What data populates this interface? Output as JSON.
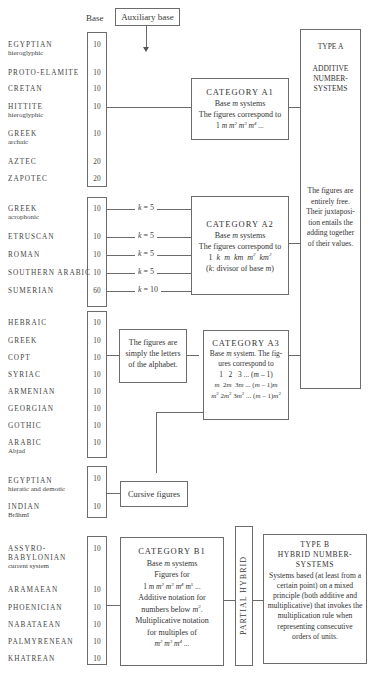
{
  "header": {
    "base_label": "Base",
    "auxiliary_base_label": "Auxiliary base"
  },
  "group1": {
    "systems": [
      {
        "name": "EGYPTIAN",
        "sub": "hieroglyphic",
        "base": "10"
      },
      {
        "name": "PROTO-ELAMITE",
        "sub": "",
        "base": "10"
      },
      {
        "name": "CRETAN",
        "sub": "",
        "base": "10"
      },
      {
        "name": "HITTITE",
        "sub": "hieroglyphic",
        "base": "10"
      },
      {
        "name": "GREEK",
        "sub": "archaic",
        "base": "10"
      },
      {
        "name": "AZTEC",
        "sub": "",
        "base": "20"
      },
      {
        "name": "ZAPOTEC",
        "sub": "",
        "base": "20"
      }
    ]
  },
  "group2": {
    "systems": [
      {
        "name": "GREEK",
        "sub": "acrophonic",
        "base": "10",
        "k": "5"
      },
      {
        "name": "ETRUSCAN",
        "sub": "",
        "base": "10",
        "k": "5"
      },
      {
        "name": "ROMAN",
        "sub": "",
        "base": "10",
        "k": "5"
      },
      {
        "name": "SOUTHERN ARABIC",
        "sub": "",
        "base": "10",
        "k": "5"
      },
      {
        "name": "SUMERIAN",
        "sub": "",
        "base": "60",
        "k": "10"
      }
    ],
    "k_symbol": "k",
    "equals": "="
  },
  "group3": {
    "systems": [
      {
        "name": "HEBRAIC",
        "sub": "",
        "base": "10"
      },
      {
        "name": "GREEK",
        "sub": "",
        "base": "10"
      },
      {
        "name": "COPT",
        "sub": "",
        "base": "10"
      },
      {
        "name": "SYRIAC",
        "sub": "",
        "base": "10"
      },
      {
        "name": "ARMENIAN",
        "sub": "",
        "base": "10"
      },
      {
        "name": "GEORGIAN",
        "sub": "",
        "base": "10"
      },
      {
        "name": "GOTHIC",
        "sub": "",
        "base": "10"
      },
      {
        "name": "ARABIC",
        "sub": "Abjad",
        "base": "10"
      }
    ],
    "letters_box": "The figures are simply the letters of the alphabet."
  },
  "group4": {
    "systems": [
      {
        "name": "EGYPTIAN",
        "sub": "hieratic and demotic",
        "base": "10"
      },
      {
        "name": "INDIAN",
        "sub": "Brāhmī",
        "base": "10"
      }
    ],
    "cursive_box": "Cursive figures"
  },
  "group5": {
    "systems": [
      {
        "name": "ASSYRO-BABYLONIAN",
        "sub": "current system",
        "base": "10"
      },
      {
        "name": "ARAMAEAN",
        "sub": "",
        "base": "10"
      },
      {
        "name": "PHOENICIAN",
        "sub": "",
        "base": "10"
      },
      {
        "name": "NABATAEAN",
        "sub": "",
        "base": "10"
      },
      {
        "name": "PALMYRENEAN",
        "sub": "",
        "base": "10"
      },
      {
        "name": "KHATREAN",
        "sub": "",
        "base": "10"
      }
    ]
  },
  "category_a1": {
    "title": "CATEGORY A1",
    "line1": "Base m systems",
    "line2": "The figures correspond to",
    "line3": "1 m m² m³ m⁴ ..."
  },
  "category_a2": {
    "title": "CATEGORY A2",
    "line1": "Base m systems",
    "line2": "The figures correspond to",
    "line3": "1 k m km m² km²",
    "line4": "(k: divisor of base m)"
  },
  "category_a3": {
    "title": "CATEGORY A3",
    "line1": "Base m system. The fig-",
    "line2": "ures correspond to",
    "line3": "1   2   3 ... (m – 1)",
    "line4": "m  2m  3m ... (m – 1)m",
    "line5": "m² 2m² 3m² ... (m – 1)m²"
  },
  "category_b1": {
    "title": "CATEGORY B1",
    "line1": "Base m systems",
    "line2": "Figures for",
    "line3": "1 m m² m³ m⁴ m⁵ ...",
    "line4": "Additive notation for",
    "line5": "numbers below m².",
    "line6": "Multiplicative notation",
    "line7": "for multiples of",
    "line8": "m² m³ m⁴ ..."
  },
  "type_a": {
    "title": "TYPE A",
    "subtitle_1": "ADDITIVE",
    "subtitle_2": "NUMBER-",
    "subtitle_3": "SYSTEMS",
    "description": "The figures are entirely free. Their juxtaposi-tion entails the adding together of their values."
  },
  "partial_hybrid": {
    "label": "PARTIAL HYBRID"
  },
  "type_b": {
    "title": "TYPE B",
    "subtitle_1": "HYBRID NUMBER-",
    "subtitle_2": "SYSTEMS",
    "description": "Systems based (at least from a certain point) on a mixed principle (both additive and multiplicative) that invokes the multiplication rule when representing consecutive orders of units."
  }
}
